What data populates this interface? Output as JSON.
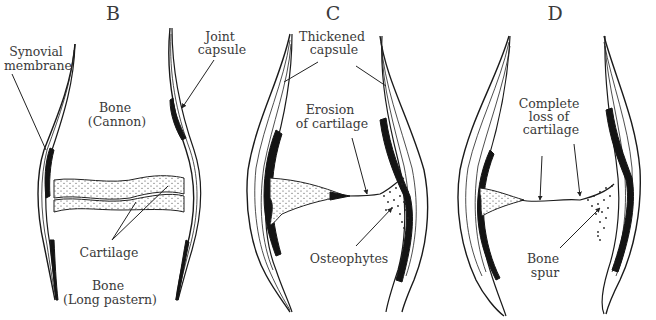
{
  "figure": {
    "type": "anatomical-diagram",
    "panels": [
      {
        "id": "B",
        "title": "B",
        "labels": {
          "synovial": [
            "Synovial",
            "membrane"
          ],
          "capsule": [
            "Joint",
            "capsule"
          ],
          "bone_top": [
            "Bone",
            "(Cannon)"
          ],
          "cartilage": "Cartilage",
          "bone_bottom": [
            "Bone",
            "(Long pastern)"
          ]
        }
      },
      {
        "id": "C",
        "title": "C",
        "labels": {
          "capsule": [
            "Thickened",
            "capsule"
          ],
          "erosion": [
            "Erosion",
            "of cartilage"
          ],
          "osteophytes": "Osteophytes"
        }
      },
      {
        "id": "D",
        "title": "D",
        "labels": {
          "loss": [
            "Complete",
            "loss of",
            "cartilage"
          ],
          "spur": [
            "Bone",
            "spur"
          ]
        }
      }
    ]
  },
  "colors": {
    "background": "#ffffff",
    "ink": "#1a1a1a",
    "label_text": "#3a3a3a"
  }
}
